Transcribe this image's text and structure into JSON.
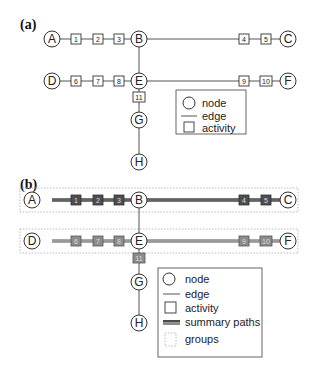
{
  "panels": {
    "a": {
      "label": "(a)",
      "nodes": {
        "A": "A",
        "B": "B",
        "C": "C",
        "D": "D",
        "E": "E",
        "F": "F",
        "G": "G",
        "H": "H"
      },
      "activities": {
        "a1": "1",
        "a2": "2",
        "a3": "3",
        "a4": "4",
        "a5": "5",
        "a6": "6",
        "a7": "7",
        "a8": "8",
        "a9": "9",
        "a10": "10",
        "a11": "11"
      },
      "legend": {
        "node": "node",
        "edge": "edge",
        "activity": "activity"
      }
    },
    "b": {
      "label": "(b)",
      "nodes": {
        "A": "A",
        "B": "B",
        "C": "C",
        "D": "D",
        "E": "E",
        "F": "F",
        "G": "G",
        "H": "H"
      },
      "activities": {
        "a1": "1",
        "a2": "2",
        "a3": "3",
        "a4": "4",
        "a5": "5",
        "a6": "6",
        "a7": "7",
        "a8": "8",
        "a9": "9",
        "a10": "10",
        "a11": "11"
      },
      "legend": {
        "node": "node",
        "edge": "edge",
        "activity": "activity",
        "summary_paths": "summary paths",
        "groups": "groups"
      }
    }
  },
  "colors": {
    "summary_path_dark": "#4a4a4a",
    "summary_path_light": "#8a8a8a",
    "activity_dark": "#4d4d4d",
    "activity_light": "#8c8c8c",
    "group_border": "#aaaaaa"
  }
}
